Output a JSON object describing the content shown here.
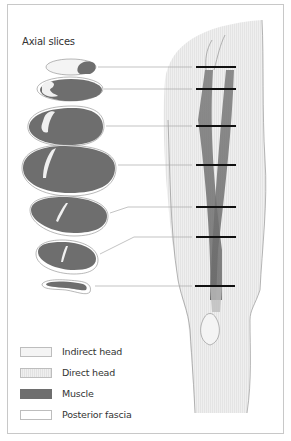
{
  "figure": {
    "title": "Axial slices",
    "colors": {
      "indirect_head": "#f2f2f2",
      "direct_head": "#ededed",
      "muscle": "#6e6e6e",
      "posterior_fascia": "#ffffff",
      "thigh": "#ececec",
      "level_marker": "#111111",
      "leader_line": "#aaaaaa"
    },
    "slices": [
      {
        "id": 1,
        "level_y": 67
      },
      {
        "id": 2,
        "level_y": 89
      },
      {
        "id": 3,
        "level_y": 126
      },
      {
        "id": 4,
        "level_y": 165
      },
      {
        "id": 5,
        "level_y": 207
      },
      {
        "id": 6,
        "level_y": 237
      },
      {
        "id": 7,
        "level_y": 286
      }
    ]
  },
  "legend": {
    "items": [
      {
        "label": "Indirect head",
        "color": "#f4f4f4"
      },
      {
        "label": "Direct head",
        "color": "#ebebeb"
      },
      {
        "label": "Muscle",
        "color": "#6e6e6e"
      },
      {
        "label": "Posterior fascia",
        "color": "#ffffff"
      }
    ]
  }
}
